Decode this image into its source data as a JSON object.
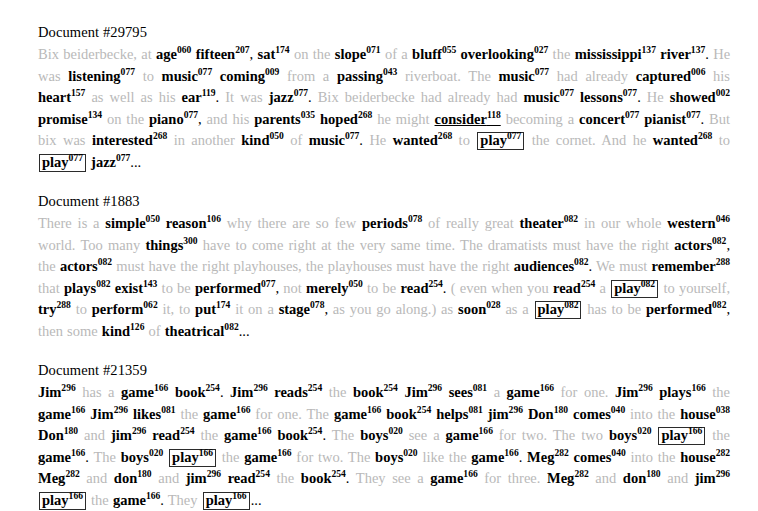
{
  "page": {
    "background": "#ffffff",
    "annotated_color": "#000000",
    "context_color": "#b9b9b9",
    "box_border_color": "#2b2b2b"
  },
  "documents": [
    {
      "title": "Document #29795",
      "tokens": [
        {
          "t": "Bix beiderbecke, at ",
          "k": "plain"
        },
        {
          "t": "age",
          "s": "060",
          "k": "ann"
        },
        {
          "t": " ",
          "k": "plain"
        },
        {
          "t": "fifteen",
          "s": "207",
          "k": "ann"
        },
        {
          "t": ", ",
          "k": "dark"
        },
        {
          "t": "sat",
          "s": "174",
          "k": "ann"
        },
        {
          "t": " on the ",
          "k": "plain"
        },
        {
          "t": "slope",
          "s": "071",
          "k": "ann"
        },
        {
          "t": " of a ",
          "k": "plain"
        },
        {
          "t": "bluff",
          "s": "055",
          "k": "ann"
        },
        {
          "t": " ",
          "k": "plain"
        },
        {
          "t": "overlooking",
          "s": "027",
          "k": "ann"
        },
        {
          "t": " the ",
          "k": "plain"
        },
        {
          "t": "mississippi",
          "s": "137",
          "k": "ann"
        },
        {
          "t": " ",
          "k": "plain"
        },
        {
          "t": "river",
          "s": "137",
          "k": "ann"
        },
        {
          "t": ". ",
          "k": "dark"
        },
        {
          "t": "He was ",
          "k": "plain"
        },
        {
          "t": "listening",
          "s": "077",
          "k": "ann"
        },
        {
          "t": " to ",
          "k": "plain"
        },
        {
          "t": "music",
          "s": "077",
          "k": "ann"
        },
        {
          "t": " ",
          "k": "plain"
        },
        {
          "t": "coming",
          "s": "009",
          "k": "ann"
        },
        {
          "t": " from a ",
          "k": "plain"
        },
        {
          "t": "passing",
          "s": "043",
          "k": "ann"
        },
        {
          "t": " riverboat. The ",
          "k": "plain"
        },
        {
          "t": "music",
          "s": "077",
          "k": "ann"
        },
        {
          "t": " had already ",
          "k": "plain"
        },
        {
          "t": "captured",
          "s": "006",
          "k": "ann"
        },
        {
          "t": " his ",
          "k": "plain"
        },
        {
          "t": "heart",
          "s": "157",
          "k": "ann"
        },
        {
          "t": " as well as his ",
          "k": "plain"
        },
        {
          "t": "ear",
          "s": "119",
          "k": "ann"
        },
        {
          "t": ". ",
          "k": "dark"
        },
        {
          "t": "It was ",
          "k": "plain"
        },
        {
          "t": "jazz",
          "s": "077",
          "k": "ann"
        },
        {
          "t": ". ",
          "k": "dark"
        },
        {
          "t": "Bix beiderbecke had already had ",
          "k": "plain"
        },
        {
          "t": "music",
          "s": "077",
          "k": "ann"
        },
        {
          "t": " ",
          "k": "plain"
        },
        {
          "t": "lessons",
          "s": "077",
          "k": "ann"
        },
        {
          "t": ". ",
          "k": "dark"
        },
        {
          "t": "He ",
          "k": "plain"
        },
        {
          "t": "showed",
          "s": "002",
          "k": "ann"
        },
        {
          "t": " ",
          "k": "plain"
        },
        {
          "t": "promise",
          "s": "134",
          "k": "ann"
        },
        {
          "t": " on the ",
          "k": "plain"
        },
        {
          "t": "piano",
          "s": "077",
          "k": "ann"
        },
        {
          "t": ", ",
          "k": "dark"
        },
        {
          "t": "and his ",
          "k": "plain"
        },
        {
          "t": "parents",
          "s": "035",
          "k": "ann"
        },
        {
          "t": " ",
          "k": "plain"
        },
        {
          "t": "hoped",
          "s": "268",
          "k": "ann"
        },
        {
          "t": " he might ",
          "k": "plain"
        },
        {
          "t": "consider",
          "s": "118",
          "k": "ann-underline"
        },
        {
          "t": " becoming a ",
          "k": "plain"
        },
        {
          "t": "concert",
          "s": "077",
          "k": "ann"
        },
        {
          "t": " ",
          "k": "plain"
        },
        {
          "t": "pianist",
          "s": "077",
          "k": "ann"
        },
        {
          "t": ". ",
          "k": "dark"
        },
        {
          "t": "But bix was ",
          "k": "plain"
        },
        {
          "t": "interested",
          "s": "268",
          "k": "ann"
        },
        {
          "t": " in another ",
          "k": "plain"
        },
        {
          "t": "kind",
          "s": "050",
          "k": "ann"
        },
        {
          "t": " of ",
          "k": "plain"
        },
        {
          "t": "music",
          "s": "077",
          "k": "ann"
        },
        {
          "t": ". ",
          "k": "dark"
        },
        {
          "t": "He ",
          "k": "plain"
        },
        {
          "t": "wanted",
          "s": "268",
          "k": "ann"
        },
        {
          "t": " to ",
          "k": "plain"
        },
        {
          "t": "play",
          "s": "077",
          "k": "box"
        },
        {
          "t": " the cornet. And he ",
          "k": "plain"
        },
        {
          "t": "wanted",
          "s": "268",
          "k": "ann"
        },
        {
          "t": " to ",
          "k": "plain"
        },
        {
          "t": "play",
          "s": "077",
          "k": "box"
        },
        {
          "t": " ",
          "k": "plain"
        },
        {
          "t": "jazz",
          "s": "077",
          "k": "ann"
        },
        {
          "t": "...",
          "k": "ellipsis"
        }
      ]
    },
    {
      "title": "Document #1883",
      "tokens": [
        {
          "t": "There is a ",
          "k": "plain"
        },
        {
          "t": "simple",
          "s": "050",
          "k": "ann"
        },
        {
          "t": " ",
          "k": "plain"
        },
        {
          "t": "reason",
          "s": "106",
          "k": "ann"
        },
        {
          "t": " why there are so few ",
          "k": "plain"
        },
        {
          "t": "periods",
          "s": "078",
          "k": "ann"
        },
        {
          "t": " of really great ",
          "k": "plain"
        },
        {
          "t": "theater",
          "s": "082",
          "k": "ann"
        },
        {
          "t": " in our whole ",
          "k": "plain"
        },
        {
          "t": "western",
          "s": "046",
          "k": "ann"
        },
        {
          "t": " world. ",
          "k": "plain"
        },
        {
          "t": "Too many ",
          "k": "plain"
        },
        {
          "t": "things",
          "s": "300",
          "k": "ann"
        },
        {
          "t": " have to come right at the very same time. The dramatists must have the right ",
          "k": "plain"
        },
        {
          "t": "actors",
          "s": "082",
          "k": "ann"
        },
        {
          "t": ", ",
          "k": "dark"
        },
        {
          "t": "the ",
          "k": "plain"
        },
        {
          "t": "actors",
          "s": "082",
          "k": "ann"
        },
        {
          "t": " must have the right playhouses, the playhouses must have the right ",
          "k": "plain"
        },
        {
          "t": "audiences",
          "s": "082",
          "k": "ann"
        },
        {
          "t": ". ",
          "k": "dark"
        },
        {
          "t": "We must ",
          "k": "plain"
        },
        {
          "t": "remember",
          "s": "288",
          "k": "ann"
        },
        {
          "t": " that ",
          "k": "plain"
        },
        {
          "t": "plays",
          "s": "082",
          "k": "ann"
        },
        {
          "t": " ",
          "k": "plain"
        },
        {
          "t": "exist",
          "s": "143",
          "k": "ann"
        },
        {
          "t": " to be ",
          "k": "plain"
        },
        {
          "t": "performed",
          "s": "077",
          "k": "ann"
        },
        {
          "t": ", ",
          "k": "dark"
        },
        {
          "t": "not ",
          "k": "plain"
        },
        {
          "t": "merely",
          "s": "050",
          "k": "ann"
        },
        {
          "t": " to be ",
          "k": "plain"
        },
        {
          "t": "read",
          "s": "254",
          "k": "ann"
        },
        {
          "t": ". ",
          "k": "dark"
        },
        {
          "t": "( even when you ",
          "k": "plain"
        },
        {
          "t": "read",
          "s": "254",
          "k": "ann"
        },
        {
          "t": " a ",
          "k": "plain"
        },
        {
          "t": "play",
          "s": "082",
          "k": "box"
        },
        {
          "t": " to yourself, ",
          "k": "plain"
        },
        {
          "t": "try",
          "s": "288",
          "k": "ann"
        },
        {
          "t": " to ",
          "k": "plain"
        },
        {
          "t": "perform",
          "s": "062",
          "k": "ann"
        },
        {
          "t": " it, to ",
          "k": "plain"
        },
        {
          "t": "put",
          "s": "174",
          "k": "ann"
        },
        {
          "t": " it on a ",
          "k": "plain"
        },
        {
          "t": "stage",
          "s": "078",
          "k": "ann"
        },
        {
          "t": ", ",
          "k": "dark"
        },
        {
          "t": "as you go along.) as ",
          "k": "plain"
        },
        {
          "t": "soon",
          "s": "028",
          "k": "ann"
        },
        {
          "t": " as a ",
          "k": "plain"
        },
        {
          "t": "play",
          "s": "082",
          "k": "box"
        },
        {
          "t": " has to be ",
          "k": "plain"
        },
        {
          "t": "performed",
          "s": "082",
          "k": "ann"
        },
        {
          "t": ", ",
          "k": "dark"
        },
        {
          "t": "then some ",
          "k": "plain"
        },
        {
          "t": "kind",
          "s": "126",
          "k": "ann"
        },
        {
          "t": " of ",
          "k": "plain"
        },
        {
          "t": "theatrical",
          "s": "082",
          "k": "ann"
        },
        {
          "t": "...",
          "k": "ellipsis"
        }
      ]
    },
    {
      "title": "Document #21359",
      "tokens": [
        {
          "t": "Jim",
          "s": "296",
          "k": "ann"
        },
        {
          "t": " has a ",
          "k": "plain"
        },
        {
          "t": "game",
          "s": "166",
          "k": "ann"
        },
        {
          "t": " ",
          "k": "plain"
        },
        {
          "t": "book",
          "s": "254",
          "k": "ann"
        },
        {
          "t": ". ",
          "k": "dark"
        },
        {
          "t": "Jim",
          "s": "296",
          "k": "ann"
        },
        {
          "t": " ",
          "k": "plain"
        },
        {
          "t": "reads",
          "s": "254",
          "k": "ann"
        },
        {
          "t": " the ",
          "k": "plain"
        },
        {
          "t": "book",
          "s": "254",
          "k": "ann"
        },
        {
          "t": " ",
          "k": "plain"
        },
        {
          "t": "Jim",
          "s": "296",
          "k": "ann"
        },
        {
          "t": " ",
          "k": "plain"
        },
        {
          "t": "sees",
          "s": "081",
          "k": "ann"
        },
        {
          "t": " a ",
          "k": "plain"
        },
        {
          "t": "game",
          "s": "166",
          "k": "ann"
        },
        {
          "t": " for one. ",
          "k": "plain"
        },
        {
          "t": "Jim",
          "s": "296",
          "k": "ann"
        },
        {
          "t": " ",
          "k": "plain"
        },
        {
          "t": "plays",
          "s": "166",
          "k": "ann"
        },
        {
          "t": " the ",
          "k": "plain"
        },
        {
          "t": "game",
          "s": "166",
          "k": "ann"
        },
        {
          "t": " ",
          "k": "plain"
        },
        {
          "t": "Jim",
          "s": "296",
          "k": "ann"
        },
        {
          "t": " ",
          "k": "plain"
        },
        {
          "t": "likes",
          "s": "081",
          "k": "ann"
        },
        {
          "t": " the ",
          "k": "plain"
        },
        {
          "t": "game",
          "s": "166",
          "k": "ann"
        },
        {
          "t": " for one. The ",
          "k": "plain"
        },
        {
          "t": "game",
          "s": "166",
          "k": "ann"
        },
        {
          "t": " ",
          "k": "plain"
        },
        {
          "t": "book",
          "s": "254",
          "k": "ann"
        },
        {
          "t": " ",
          "k": "plain"
        },
        {
          "t": "helps",
          "s": "081",
          "k": "ann"
        },
        {
          "t": " ",
          "k": "plain"
        },
        {
          "t": "jim",
          "s": "296",
          "k": "ann"
        },
        {
          "t": " ",
          "k": "plain"
        },
        {
          "t": "Don",
          "s": "180",
          "k": "ann"
        },
        {
          "t": " ",
          "k": "plain"
        },
        {
          "t": "comes",
          "s": "040",
          "k": "ann"
        },
        {
          "t": " into the ",
          "k": "plain"
        },
        {
          "t": "house",
          "s": "038",
          "k": "ann"
        },
        {
          "t": " ",
          "k": "plain"
        },
        {
          "t": "Don",
          "s": "180",
          "k": "ann"
        },
        {
          "t": " and ",
          "k": "plain"
        },
        {
          "t": "jim",
          "s": "296",
          "k": "ann"
        },
        {
          "t": " ",
          "k": "plain"
        },
        {
          "t": "read",
          "s": "254",
          "k": "ann"
        },
        {
          "t": " the ",
          "k": "plain"
        },
        {
          "t": "game",
          "s": "166",
          "k": "ann"
        },
        {
          "t": " ",
          "k": "plain"
        },
        {
          "t": "book",
          "s": "254",
          "k": "ann"
        },
        {
          "t": ". ",
          "k": "dark"
        },
        {
          "t": "The ",
          "k": "plain"
        },
        {
          "t": "boys",
          "s": "020",
          "k": "ann"
        },
        {
          "t": " see a ",
          "k": "plain"
        },
        {
          "t": "game",
          "s": "166",
          "k": "ann"
        },
        {
          "t": " for two. The two ",
          "k": "plain"
        },
        {
          "t": "boys",
          "s": "020",
          "k": "ann"
        },
        {
          "t": " ",
          "k": "plain"
        },
        {
          "t": "play",
          "s": "166",
          "k": "box"
        },
        {
          "t": " the ",
          "k": "plain"
        },
        {
          "t": "game",
          "s": "166",
          "k": "ann"
        },
        {
          "t": ". ",
          "k": "dark"
        },
        {
          "t": "The ",
          "k": "plain"
        },
        {
          "t": "boys",
          "s": "020",
          "k": "ann"
        },
        {
          "t": " ",
          "k": "plain"
        },
        {
          "t": "play",
          "s": "166",
          "k": "box"
        },
        {
          "t": " the ",
          "k": "plain"
        },
        {
          "t": "game",
          "s": "166",
          "k": "ann"
        },
        {
          "t": " for two. The ",
          "k": "plain"
        },
        {
          "t": "boys",
          "s": "020",
          "k": "ann"
        },
        {
          "t": " like the ",
          "k": "plain"
        },
        {
          "t": "game",
          "s": "166",
          "k": "ann"
        },
        {
          "t": ". ",
          "k": "dark"
        },
        {
          "t": "Meg",
          "s": "282",
          "k": "ann"
        },
        {
          "t": " ",
          "k": "plain"
        },
        {
          "t": "comes",
          "s": "040",
          "k": "ann"
        },
        {
          "t": " into the ",
          "k": "plain"
        },
        {
          "t": "house",
          "s": "282",
          "k": "ann"
        },
        {
          "t": " ",
          "k": "plain"
        },
        {
          "t": "Meg",
          "s": "282",
          "k": "ann"
        },
        {
          "t": " and ",
          "k": "plain"
        },
        {
          "t": "don",
          "s": "180",
          "k": "ann"
        },
        {
          "t": " and ",
          "k": "plain"
        },
        {
          "t": "jim",
          "s": "296",
          "k": "ann"
        },
        {
          "t": " ",
          "k": "plain"
        },
        {
          "t": "read",
          "s": "254",
          "k": "ann"
        },
        {
          "t": " the ",
          "k": "plain"
        },
        {
          "t": "book",
          "s": "254",
          "k": "ann"
        },
        {
          "t": ". ",
          "k": "dark"
        },
        {
          "t": "They see a ",
          "k": "plain"
        },
        {
          "t": "game",
          "s": "166",
          "k": "ann"
        },
        {
          "t": " for three. ",
          "k": "plain"
        },
        {
          "t": "Meg",
          "s": "282",
          "k": "ann"
        },
        {
          "t": " and ",
          "k": "plain"
        },
        {
          "t": "don",
          "s": "180",
          "k": "ann"
        },
        {
          "t": " and ",
          "k": "plain"
        },
        {
          "t": "jim",
          "s": "296",
          "k": "ann"
        },
        {
          "t": " ",
          "k": "plain"
        },
        {
          "t": "play",
          "s": "166",
          "k": "box"
        },
        {
          "t": " the ",
          "k": "plain"
        },
        {
          "t": "game",
          "s": "166",
          "k": "ann"
        },
        {
          "t": ". ",
          "k": "dark"
        },
        {
          "t": "They ",
          "k": "plain"
        },
        {
          "t": "play",
          "s": "166",
          "k": "box"
        },
        {
          "t": "...",
          "k": "ellipsis"
        }
      ]
    }
  ]
}
